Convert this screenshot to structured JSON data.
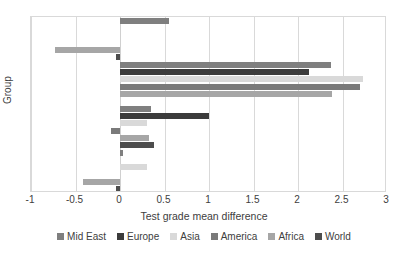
{
  "chart_data": {
    "type": "bar",
    "orientation": "horizontal",
    "title": "",
    "xlabel": "Test grade mean difference",
    "ylabel": "Group",
    "categories": [
      "G1(2018-2017)",
      "G2(2019-2018)",
      "G3(2020-2019)",
      "G4(2021-2020)"
    ],
    "xlim": [
      -1,
      3
    ],
    "xticks": [
      -1,
      -0.5,
      0,
      0.5,
      1,
      1.5,
      2,
      2.5,
      3
    ],
    "xticklabels": [
      "-1",
      "-0.5",
      "0",
      "0.5",
      "1",
      "1.5",
      "2",
      "2.5",
      "3"
    ],
    "grid": true,
    "legend_position": "bottom",
    "series": [
      {
        "name": "Mid East",
        "color": "#7f7f7f",
        "values": [
          0.03,
          0.35,
          2.37,
          0.55
        ]
      },
      {
        "name": "Europe",
        "color": "#3b3b3b",
        "values": [
          0.0,
          1.0,
          2.12,
          0.0
        ]
      },
      {
        "name": "Asia",
        "color": "#d9d9d9",
        "values": [
          0.3,
          0.3,
          2.73,
          0.0
        ]
      },
      {
        "name": "America",
        "color": "#7a7a7a",
        "values": [
          0.0,
          -0.1,
          2.7,
          0.0
        ]
      },
      {
        "name": "Africa",
        "color": "#a6a6a6",
        "values": [
          -0.42,
          0.33,
          2.38,
          -0.73
        ]
      },
      {
        "name": "World",
        "color": "#4d4d4d",
        "values": [
          -0.05,
          0.38,
          0.0,
          -0.04
        ]
      }
    ]
  },
  "legend": {
    "items": [
      {
        "label": "Mid East"
      },
      {
        "label": "Europe"
      },
      {
        "label": "Asia"
      },
      {
        "label": "America"
      },
      {
        "label": "Africa"
      },
      {
        "label": "World"
      }
    ]
  },
  "axes": {
    "x_title": "Test grade mean difference",
    "y_title": "Group"
  }
}
